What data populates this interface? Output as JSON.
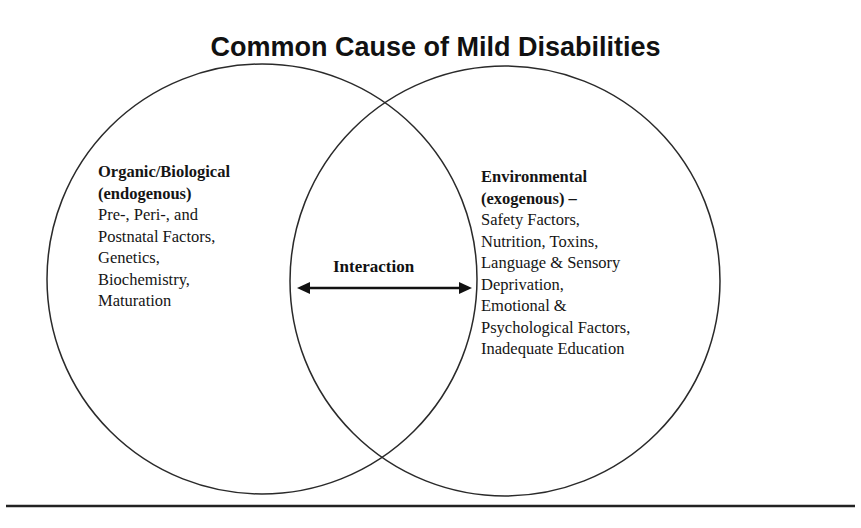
{
  "title": "Common Cause of Mild Disabilities",
  "left_circle": {
    "heading": [
      "Organic/Biological",
      "(endogenous)"
    ],
    "items": [
      "Pre-, Peri-, and",
      "Postnatal Factors,",
      "Genetics,",
      "Biochemistry,",
      "Maturation"
    ]
  },
  "right_circle": {
    "heading": [
      "Environmental",
      "(exogenous) –"
    ],
    "items": [
      "Safety Factors,",
      "Nutrition, Toxins,",
      "Language & Sensory",
      "Deprivation,",
      "Emotional &",
      "Psychological Factors,",
      "Inadequate Education"
    ]
  },
  "overlap": {
    "label": "Interaction",
    "arrow": "double-headed-arrow"
  },
  "colors": {
    "stroke": "#2a2a2a",
    "text": "#151515",
    "background": "#ffffff"
  }
}
